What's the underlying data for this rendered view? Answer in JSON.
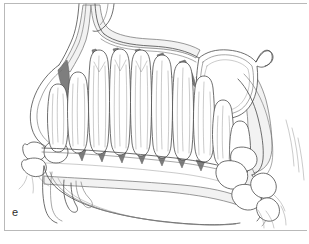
{
  "figure": {
    "label": "e",
    "kind": "anatomical-line-illustration",
    "background_color": "#ffffff",
    "frame_color": "#b9b9b9",
    "line_color": "#4a4a4a",
    "bone_shade_color": "#f2f2f2",
    "interdental_shade_color": "#7e7e7e",
    "midtone_shade_color": "#bfbfbf",
    "label_color": "#2b2b2b"
  },
  "regions": [
    {
      "name": "nasal-cavity-superior",
      "shade": "#f2f2f2"
    },
    {
      "name": "maxillary-sinus-cavity",
      "shade": "#ffffff"
    },
    {
      "name": "tooth-germ-row",
      "count": 11,
      "shade": "#ffffff"
    },
    {
      "name": "interdental-shading",
      "shade": "#7e7e7e"
    },
    {
      "name": "alveolar-crest-line",
      "shade": "#4a4a4a"
    },
    {
      "name": "hard-palate",
      "shade": "#ffffff"
    },
    {
      "name": "pterygoid-plate",
      "shade": "#f2f2f2"
    },
    {
      "name": "anterior-tooth-cluster",
      "shade": "#ffffff"
    },
    {
      "name": "posterior-tooth-cluster",
      "shade": "#ffffff"
    }
  ]
}
